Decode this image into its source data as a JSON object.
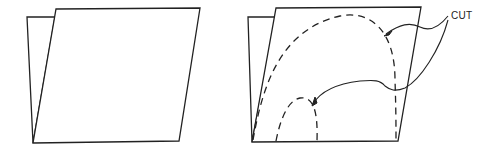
{
  "figure": {
    "panels": [
      {
        "id": "left",
        "description": "folded sheet, uncut"
      },
      {
        "id": "right",
        "description": "folded sheet with dashed cut lines"
      }
    ],
    "callout": {
      "label": "CUT"
    },
    "colors": {
      "line": "#222222",
      "background": "#ffffff"
    }
  }
}
